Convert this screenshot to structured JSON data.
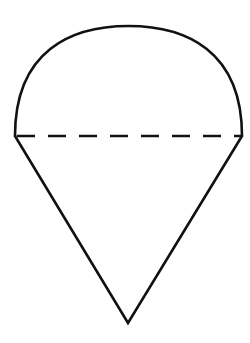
{
  "figure": {
    "description": "Ice-cream-cone shape: a semicircular dome on top of an inverted isosceles triangle, separated by a dashed horizontal diameter line",
    "stroke_color": "#111111",
    "background": "#ffffff",
    "shapes": {
      "dome": {
        "type": "semicircle-arc",
        "left": [
          15,
          136
        ],
        "right": [
          242,
          136
        ],
        "top_y": 26
      },
      "diameter": {
        "type": "dashed-line",
        "from": [
          15,
          136
        ],
        "to": [
          242,
          136
        ],
        "dash": 18,
        "gap": 13
      },
      "cone": {
        "type": "triangle",
        "vertices": [
          [
            15,
            136
          ],
          [
            242,
            136
          ],
          [
            128,
            323
          ]
        ]
      }
    }
  }
}
